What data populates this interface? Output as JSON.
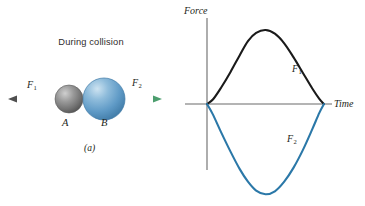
{
  "figure": {
    "background_color": "#ffffff"
  },
  "panel_a": {
    "caption": "(a)",
    "heading": "During collision",
    "bodies": [
      {
        "id": "A",
        "label": "A",
        "color": "#7d7d7d",
        "highlight_color": "#c9c9c9",
        "shadow_color": "#4a4a4a",
        "radius": 14,
        "center_x": 69,
        "center_y": 99
      },
      {
        "id": "B",
        "label": "B",
        "color": "#5b97c4",
        "highlight_color": "#b6d6ea",
        "shadow_color": "#3d739c",
        "radius": 21,
        "center_x": 104,
        "center_y": 99
      }
    ],
    "arrow": {
      "left_label": "F",
      "left_sub": "1",
      "right_label": "F",
      "right_sub": "2",
      "shaft_color": "#6b6b6b",
      "right_tip_color": "#7cc89a",
      "y": 99,
      "x_start": 10,
      "x_end": 160
    }
  },
  "panel_b": {
    "caption": "(b)",
    "axis_color": "#6b6b6b"
  },
  "chart_data": {
    "type": "line",
    "title": "",
    "xlabel": "Time",
    "ylabel": "Force",
    "grid": false,
    "legend": "inline-annotations",
    "xlim": [
      0,
      1
    ],
    "ylim": [
      -1.25,
      1.0
    ],
    "axes": {
      "x_axis_label": "Time",
      "y_axis_label": "Force",
      "x_axis_pixel_y": 104,
      "y_axis_pixel_x": 25,
      "tick_labels_x": [],
      "tick_labels_y": []
    },
    "series": [
      {
        "name": "F1",
        "label": "F",
        "label_sub": "1",
        "color": "#1a1a1a",
        "annotation": "F₁",
        "description": "Force on body A: positive pulse, rises from zero, peaks, returns to zero",
        "x": [
          0.0,
          0.05,
          0.12,
          0.2,
          0.28,
          0.35,
          0.42,
          0.5,
          0.58,
          0.66,
          0.74,
          0.82,
          0.9,
          0.96,
          1.0
        ],
        "y": [
          0.0,
          0.06,
          0.22,
          0.43,
          0.66,
          0.85,
          0.96,
          1.0,
          0.95,
          0.82,
          0.63,
          0.42,
          0.21,
          0.07,
          0.0
        ]
      },
      {
        "name": "F2",
        "label": "F",
        "label_sub": "2",
        "color": "#2b78a8",
        "annotation": "F₂",
        "description": "Force on body B: negative pulse, equal and opposite reaction, deeper and broader trough",
        "x": [
          0.0,
          0.05,
          0.12,
          0.2,
          0.28,
          0.35,
          0.42,
          0.5,
          0.58,
          0.66,
          0.74,
          0.82,
          0.9,
          0.96,
          1.0
        ],
        "y": [
          0.0,
          -0.14,
          -0.38,
          -0.64,
          -0.88,
          -1.05,
          -1.17,
          -1.22,
          -1.18,
          -1.05,
          -0.86,
          -0.62,
          -0.34,
          -0.12,
          0.0
        ]
      }
    ],
    "annotations": [
      {
        "text": "F₁",
        "x": 0.72,
        "y": 0.55
      },
      {
        "text": "F₂",
        "x": 0.7,
        "y": -0.55
      }
    ]
  }
}
